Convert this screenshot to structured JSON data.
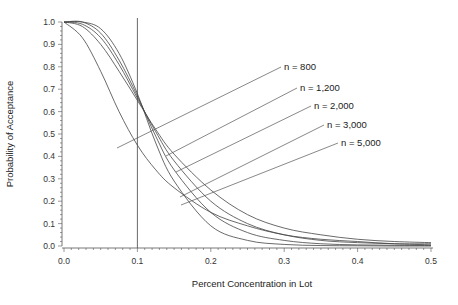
{
  "chart_data": {
    "type": "line",
    "title": "",
    "xlabel": "Percent Concentration in Lot",
    "ylabel": "Probability of Acceptance",
    "xlim": [
      0.0,
      0.5
    ],
    "ylim": [
      0.0,
      1.0
    ],
    "x_ticks": [
      "0.0",
      "0.1",
      "0.2",
      "0.3",
      "0.4",
      "0.5"
    ],
    "y_ticks": [
      "0.0",
      "0.1",
      "0.2",
      "0.3",
      "0.4",
      "0.5",
      "0.6",
      "0.7",
      "0.8",
      "0.9",
      "1.0"
    ],
    "grid": false,
    "reference_line": {
      "x": 0.1,
      "orientation": "vertical"
    },
    "x": [
      0.0,
      0.025,
      0.05,
      0.075,
      0.1,
      0.125,
      0.15,
      0.2,
      0.25,
      0.3,
      0.35,
      0.4,
      0.45,
      0.5
    ],
    "series": [
      {
        "name": "n = 800",
        "values": [
          1.0,
          0.93,
          0.78,
          0.6,
          0.45,
          0.34,
          0.26,
          0.15,
          0.09,
          0.05,
          0.03,
          0.02,
          0.01,
          0.01
        ]
      },
      {
        "name": "n = 1,200",
        "values": [
          1.0,
          0.98,
          0.9,
          0.78,
          0.65,
          0.52,
          0.41,
          0.25,
          0.14,
          0.08,
          0.05,
          0.03,
          0.02,
          0.015
        ]
      },
      {
        "name": "n = 2,000",
        "values": [
          1.0,
          0.99,
          0.93,
          0.81,
          0.66,
          0.51,
          0.38,
          0.2,
          0.1,
          0.05,
          0.025,
          0.015,
          0.01,
          0.005
        ]
      },
      {
        "name": "n = 3,000",
        "values": [
          1.0,
          1.0,
          0.95,
          0.83,
          0.67,
          0.49,
          0.34,
          0.15,
          0.06,
          0.025,
          0.01,
          0.005,
          0.003,
          0.002
        ]
      },
      {
        "name": "n = 5,000",
        "values": [
          1.0,
          1.0,
          0.97,
          0.86,
          0.68,
          0.46,
          0.29,
          0.09,
          0.025,
          0.007,
          0.002,
          0.001,
          0.0,
          0.0
        ]
      }
    ],
    "annotations": [
      {
        "text": "n = 800",
        "label_pos": [
          0.4,
          0.0
        ],
        "points_to_series": "n = 800"
      },
      {
        "text": "n = 1,200",
        "points_to_series": "n = 1,200"
      },
      {
        "text": "n = 2,000",
        "points_to_series": "n = 2,000"
      },
      {
        "text": "n = 3,000",
        "points_to_series": "n = 3,000"
      },
      {
        "text": "n = 5,000",
        "points_to_series": "n = 5,000"
      }
    ]
  },
  "labels": {
    "xlabel": "Percent Concentration in Lot",
    "ylabel": "Probability of Acceptance",
    "n800": "n = 800",
    "n1200": "n = 1,200",
    "n2000": "n = 2,000",
    "n3000": "n = 3,000",
    "n5000": "n = 5,000"
  }
}
